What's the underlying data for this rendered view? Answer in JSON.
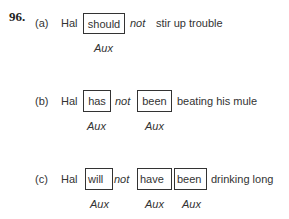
{
  "example_number": "96.",
  "examples": [
    {
      "label": "(a)",
      "subject": "Hal",
      "aux1": "should",
      "neg": "not",
      "rest": "stir up trouble",
      "aux_labels": [
        "Aux"
      ]
    },
    {
      "label": "(b)",
      "subject": "Hal",
      "aux1": "has",
      "neg": "not",
      "aux2": "been",
      "rest": "beating his mule",
      "aux_labels": [
        "Aux",
        "Aux"
      ]
    },
    {
      "label": "(c)",
      "subject": "Hal",
      "aux1": "will",
      "neg": "not",
      "aux2": "have",
      "aux3": "been",
      "rest": "drinking long",
      "aux_labels": [
        "Aux",
        "Aux",
        "Aux"
      ]
    }
  ]
}
